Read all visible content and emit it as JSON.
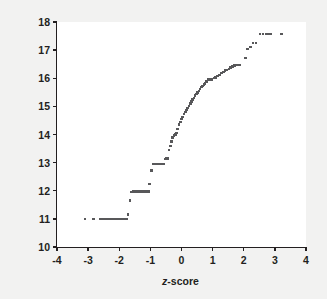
{
  "figure": {
    "background_color": "#f2f2f1",
    "panel_color": "#ffffff",
    "axis_color": "#231f20",
    "point_color": "#58585a"
  },
  "axes": {
    "x_label_prefix": "z",
    "x_label_suffix": "-score",
    "x_label_full": "z-score",
    "y_label": "Age at onset of anorexia (years)",
    "x_ticks": [
      "-4",
      "-3",
      "-2",
      "-1",
      "0",
      "1",
      "2",
      "3",
      "4"
    ],
    "y_ticks": [
      "10",
      "11",
      "12",
      "13",
      "14",
      "15",
      "16",
      "17",
      "18"
    ]
  },
  "chart_data": {
    "type": "scatter",
    "title": "",
    "xlabel": "z-score",
    "ylabel": "Age at onset of anorexia (years)",
    "xlim": [
      -4,
      4
    ],
    "ylim": [
      10,
      18
    ],
    "xticks": [
      -4,
      -3,
      -2,
      -1,
      0,
      1,
      2,
      3,
      4
    ],
    "yticks": [
      10,
      11,
      12,
      13,
      14,
      15,
      16,
      17,
      18
    ],
    "grid": false,
    "legend": null,
    "marker": "square",
    "marker_color": "#58585a",
    "x": [
      -3.1,
      -2.82,
      -2.62,
      -2.55,
      -2.48,
      -2.41,
      -2.35,
      -2.29,
      -2.23,
      -2.17,
      -2.12,
      -2.07,
      -2.02,
      -1.97,
      -1.92,
      -1.88,
      -1.84,
      -1.8,
      -1.76,
      -1.72,
      -1.66,
      -1.6,
      -1.55,
      -1.5,
      -1.46,
      -1.42,
      -1.38,
      -1.34,
      -1.3,
      -1.26,
      -1.22,
      -1.18,
      -1.14,
      -1.1,
      -1.06,
      -1.02,
      -0.97,
      -0.92,
      -0.88,
      -0.84,
      -0.8,
      -0.76,
      -0.72,
      -0.68,
      -0.64,
      -0.6,
      -0.56,
      -0.52,
      -0.48,
      -0.44,
      -0.4,
      -0.36,
      -0.32,
      -0.28,
      -0.24,
      -0.2,
      -0.16,
      -0.12,
      -0.08,
      -0.04,
      0.0,
      0.04,
      0.08,
      0.12,
      0.16,
      0.2,
      0.24,
      0.28,
      0.32,
      0.36,
      0.4,
      0.44,
      0.48,
      0.52,
      0.56,
      0.6,
      0.64,
      0.68,
      0.72,
      0.76,
      0.8,
      0.86,
      0.92,
      0.98,
      1.04,
      1.1,
      1.16,
      1.22,
      1.28,
      1.34,
      1.4,
      1.46,
      1.52,
      1.58,
      1.64,
      1.7,
      1.76,
      1.82,
      1.88,
      2.05,
      2.12,
      2.22,
      2.3,
      2.4,
      2.52,
      2.62,
      2.72,
      2.8,
      2.88,
      3.22
    ],
    "y": [
      11.0,
      11.0,
      11.0,
      11.0,
      11.0,
      11.0,
      11.0,
      11.0,
      11.0,
      11.0,
      11.0,
      11.0,
      11.0,
      11.0,
      11.0,
      11.0,
      11.0,
      11.0,
      11.0,
      11.15,
      11.65,
      11.95,
      11.97,
      11.97,
      11.97,
      11.97,
      11.97,
      11.97,
      11.97,
      11.97,
      11.97,
      11.97,
      11.97,
      11.97,
      11.97,
      12.25,
      12.72,
      12.95,
      12.95,
      12.95,
      12.95,
      12.95,
      12.95,
      12.95,
      12.95,
      12.95,
      12.95,
      13.12,
      13.15,
      13.15,
      13.45,
      13.6,
      13.75,
      13.9,
      13.97,
      14.0,
      14.05,
      14.2,
      14.35,
      14.45,
      14.55,
      14.62,
      14.72,
      14.8,
      14.88,
      14.95,
      15.02,
      15.1,
      15.18,
      15.25,
      15.3,
      15.38,
      15.45,
      15.5,
      15.55,
      15.62,
      15.68,
      15.72,
      15.78,
      15.82,
      15.88,
      15.95,
      15.95,
      15.95,
      16.0,
      16.02,
      16.08,
      16.12,
      16.18,
      16.22,
      16.28,
      16.3,
      16.33,
      16.38,
      16.42,
      16.45,
      16.47,
      16.48,
      16.48,
      16.72,
      17.05,
      17.12,
      17.25,
      17.25,
      17.58,
      17.58,
      17.58,
      17.58,
      17.58,
      17.58
    ]
  }
}
